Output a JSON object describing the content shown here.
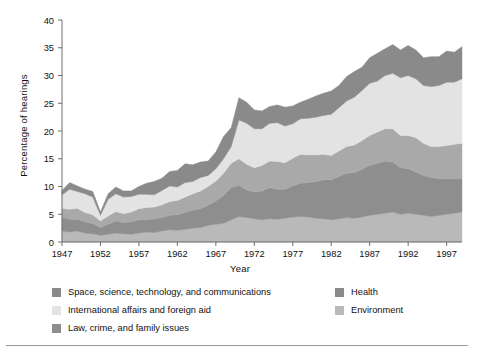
{
  "chart_data": {
    "type": "area",
    "stacked": true,
    "title": "",
    "xlabel": "Year",
    "ylabel": "Percentage of hearings",
    "xlim": [
      1947,
      1999
    ],
    "ylim": [
      0,
      40
    ],
    "ytick_step": 5,
    "yticks": [
      0,
      5,
      10,
      15,
      20,
      25,
      30,
      35,
      40
    ],
    "xticks": [
      1947,
      1952,
      1957,
      1962,
      1967,
      1972,
      1977,
      1982,
      1987,
      1992,
      1997
    ],
    "grid": false,
    "legend_position": "below-plot",
    "x": [
      1947,
      1948,
      1949,
      1950,
      1951,
      1952,
      1953,
      1954,
      1955,
      1956,
      1957,
      1958,
      1959,
      1960,
      1961,
      1962,
      1963,
      1964,
      1965,
      1966,
      1967,
      1968,
      1969,
      1970,
      1971,
      1972,
      1973,
      1974,
      1975,
      1976,
      1977,
      1978,
      1979,
      1980,
      1981,
      1982,
      1983,
      1984,
      1985,
      1986,
      1987,
      1988,
      1989,
      1990,
      1991,
      1992,
      1993,
      1994,
      1995,
      1996,
      1997,
      1998,
      1999
    ],
    "series": [
      {
        "name": "Environment",
        "color": "#b9b9b9",
        "values": [
          2.0,
          1.8,
          2.0,
          1.6,
          1.5,
          1.2,
          1.4,
          1.6,
          1.5,
          1.4,
          1.6,
          1.8,
          1.7,
          2.0,
          2.2,
          2.1,
          2.3,
          2.5,
          2.6,
          3.0,
          3.2,
          3.4,
          4.0,
          4.6,
          4.4,
          4.2,
          4.0,
          4.2,
          4.1,
          4.3,
          4.5,
          4.6,
          4.5,
          4.3,
          4.2,
          4.0,
          4.2,
          4.4,
          4.3,
          4.5,
          4.8,
          5.0,
          5.2,
          5.4,
          5.0,
          5.2,
          5.0,
          4.8,
          4.6,
          4.8,
          5.0,
          5.2,
          5.4
        ]
      },
      {
        "name": "Law, crime, and family issues",
        "color": "#8e8e8e",
        "values": [
          2.5,
          2.3,
          2.1,
          2.0,
          1.8,
          1.4,
          1.8,
          2.2,
          2.0,
          2.2,
          2.4,
          2.2,
          2.5,
          2.4,
          2.6,
          2.8,
          3.0,
          3.2,
          3.4,
          3.6,
          4.2,
          5.0,
          5.8,
          5.6,
          5.0,
          4.8,
          5.2,
          5.6,
          5.4,
          5.2,
          5.6,
          6.0,
          6.2,
          6.6,
          7.0,
          7.2,
          7.6,
          8.0,
          8.2,
          8.6,
          9.0,
          9.2,
          9.4,
          9.0,
          8.4,
          8.0,
          7.6,
          7.2,
          7.0,
          6.6,
          6.4,
          6.2,
          6.0
        ]
      },
      {
        "name": "Health",
        "color": "#a9a9a9",
        "values": [
          1.6,
          1.8,
          2.0,
          1.7,
          1.6,
          1.2,
          1.5,
          1.7,
          1.6,
          1.8,
          2.0,
          2.2,
          2.1,
          2.3,
          2.5,
          2.6,
          2.8,
          3.0,
          3.2,
          3.4,
          3.6,
          4.0,
          4.4,
          4.8,
          4.6,
          4.4,
          4.6,
          4.8,
          5.0,
          4.8,
          5.0,
          5.2,
          5.0,
          4.8,
          4.6,
          4.4,
          4.6,
          4.8,
          5.0,
          5.2,
          5.4,
          5.6,
          5.8,
          6.0,
          5.8,
          6.0,
          6.2,
          5.8,
          5.6,
          5.8,
          6.0,
          6.2,
          6.4
        ]
      },
      {
        "name": "International affairs and foreign aid",
        "color": "#e3e3e3",
        "values": [
          2.4,
          3.6,
          3.0,
          3.4,
          3.2,
          1.0,
          3.0,
          3.2,
          3.0,
          2.8,
          2.6,
          2.4,
          2.2,
          2.6,
          2.8,
          2.4,
          2.6,
          2.2,
          2.4,
          2.0,
          2.2,
          2.6,
          3.0,
          7.0,
          7.4,
          7.0,
          6.6,
          6.8,
          7.0,
          6.6,
          6.2,
          6.4,
          6.6,
          6.8,
          7.0,
          7.4,
          7.8,
          8.2,
          8.6,
          9.0,
          9.4,
          9.2,
          9.6,
          10.0,
          10.4,
          10.8,
          10.6,
          10.4,
          10.8,
          11.0,
          11.4,
          11.2,
          11.6
        ]
      },
      {
        "name": "Space, science, technology, and communications",
        "color": "#8a8a8a",
        "values": [
          0.8,
          1.2,
          1.0,
          0.8,
          1.0,
          0.6,
          1.0,
          1.2,
          1.1,
          1.0,
          1.4,
          2.0,
          2.4,
          2.2,
          2.6,
          3.0,
          3.4,
          3.0,
          2.8,
          2.6,
          3.0,
          4.0,
          3.4,
          4.0,
          3.8,
          3.4,
          3.2,
          3.0,
          3.2,
          3.4,
          3.2,
          3.0,
          3.4,
          3.8,
          4.0,
          4.2,
          4.0,
          4.4,
          4.6,
          4.2,
          4.6,
          5.0,
          4.8,
          5.2,
          5.0,
          5.4,
          5.2,
          5.0,
          5.4,
          5.2,
          5.6,
          5.4,
          5.8
        ]
      }
    ],
    "totals_note": "Stacked totals range from about 7% in 1952 to about 35% in 1999"
  },
  "legend": {
    "items": [
      {
        "label": "Space, science, technology, and communications",
        "color": "#8a8a8a",
        "column": "left"
      },
      {
        "label": "International affairs and foreign aid",
        "color": "#e3e3e3",
        "column": "left"
      },
      {
        "label": "Law, crime, and family issues",
        "color": "#8e8e8e",
        "column": "left"
      },
      {
        "label": "Health",
        "color": "#8a8a8a",
        "column": "right"
      },
      {
        "label": "Environment",
        "color": "#b9b9b9",
        "column": "right"
      }
    ]
  }
}
